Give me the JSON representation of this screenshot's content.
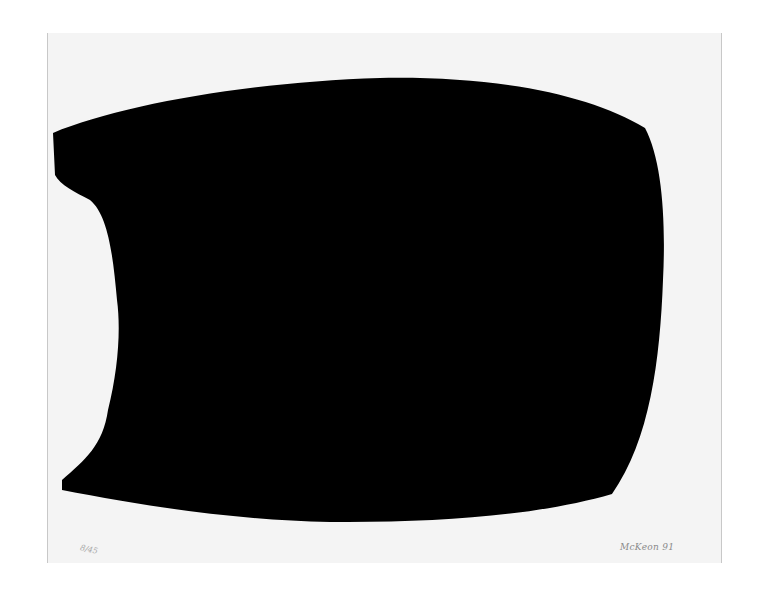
{
  "artwork": {
    "edition_number": "8/45",
    "signature": "McKeon 91",
    "colors": {
      "paper": "#f4f4f4",
      "ink": "#000000",
      "background": "#ffffff"
    }
  }
}
